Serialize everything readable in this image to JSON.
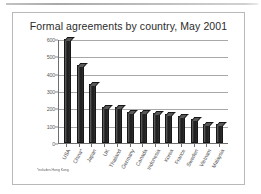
{
  "slide": {
    "footnote": "*includes Hong Kong"
  },
  "chart_data": {
    "type": "bar",
    "title": "Formal agreements by country, May 2001",
    "xlabel": "",
    "ylabel": "",
    "ylim": [
      0,
      600
    ],
    "yticks": [
      0,
      100,
      200,
      300,
      400,
      500,
      600
    ],
    "ytick_labels": [
      "0",
      "100",
      "200",
      "300",
      "400",
      "500",
      "600"
    ],
    "grid": true,
    "legend": "none",
    "categories": [
      "USA",
      "China*",
      "Japan",
      "UK",
      "Thailand",
      "Germany",
      "Canada",
      "Indonesia",
      "Korea",
      "France",
      "Sweden",
      "Vietnam",
      "Malaysia"
    ],
    "values": [
      600,
      450,
      340,
      207,
      205,
      180,
      178,
      172,
      168,
      157,
      140,
      112,
      112
    ],
    "bar_color": "#1c1c1c",
    "gridline_color": "#a8a8a8",
    "axis_color": "#6e6e6e"
  }
}
